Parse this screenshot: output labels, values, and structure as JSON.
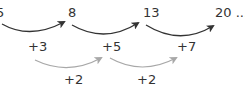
{
  "diagram": {
    "terms": [
      {
        "label": "5",
        "x": -4,
        "y": 6
      },
      {
        "label": "8",
        "x": 68,
        "y": 6
      },
      {
        "label": "13",
        "x": 143,
        "y": 6
      },
      {
        "label": "20 ...",
        "x": 215,
        "y": 6
      }
    ],
    "first_differences": [
      {
        "label": "+3",
        "x": 28,
        "y": 40
      },
      {
        "label": "+5",
        "x": 102,
        "y": 40
      },
      {
        "label": "+7",
        "x": 177,
        "y": 40
      }
    ],
    "second_differences": [
      {
        "label": "+2",
        "x": 64,
        "y": 73
      },
      {
        "label": "+2",
        "x": 137,
        "y": 73
      }
    ],
    "colors": {
      "primary_arrow": "#333333",
      "secondary_arrow": "#a8a8a8",
      "text": "#333333"
    }
  }
}
